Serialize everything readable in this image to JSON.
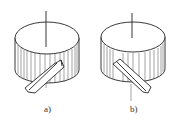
{
  "figure": {
    "type": "technical-line-drawing",
    "panels": [
      {
        "id": "a",
        "label": "a)",
        "slot_direction": "down-left"
      },
      {
        "id": "b",
        "label": "b)",
        "slot_direction": "down-right"
      }
    ],
    "colors": {
      "line": "#222222",
      "background": "#ffffff"
    }
  }
}
